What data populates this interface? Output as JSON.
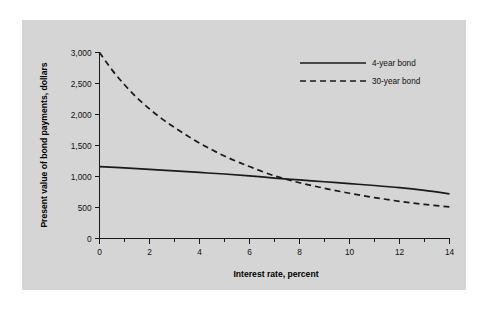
{
  "figure": {
    "panel_color": "#d5d5d5",
    "background_color": "#ffffff",
    "ink_color": "#1a1a1a"
  },
  "chart_data": {
    "type": "line",
    "title": "",
    "subtitle": "",
    "xlabel": "Interest rate, percent",
    "ylabel": "Present value of bond payments, dollars",
    "xlim": [
      0,
      14
    ],
    "ylim": [
      0,
      3000
    ],
    "xticks": [
      0,
      2,
      4,
      6,
      8,
      10,
      12,
      14
    ],
    "xticklabels": [
      "0",
      "2",
      "4",
      "6",
      "8",
      "10",
      "12",
      "14"
    ],
    "xminorticks": [
      1,
      3,
      5,
      7,
      9,
      11,
      13
    ],
    "yticks": [
      0,
      500,
      1000,
      1500,
      2000,
      2500,
      3000
    ],
    "yticklabels": [
      "0",
      "500",
      "1,000",
      "1,500",
      "2,000",
      "2,500",
      "3,000"
    ],
    "grid": false,
    "legend_position": "upper right",
    "annotations": [],
    "series": [
      {
        "name": "4-year bond",
        "style": "solid",
        "x": [
          0,
          1,
          2,
          3,
          4,
          5,
          6,
          7,
          8,
          9,
          10,
          11,
          12,
          13,
          14
        ],
        "values": [
          1160,
          1140,
          1115,
          1090,
          1065,
          1040,
          1010,
          975,
          945,
          915,
          885,
          855,
          820,
          775,
          720
        ]
      },
      {
        "name": "30-year bond",
        "style": "dashed",
        "x": [
          0,
          0.5,
          1,
          1.5,
          2,
          2.5,
          3,
          3.5,
          4,
          4.5,
          5,
          5.5,
          6,
          7,
          8,
          9,
          10,
          11,
          12,
          13,
          14
        ],
        "values": [
          3000,
          2720,
          2480,
          2270,
          2090,
          1930,
          1790,
          1660,
          1540,
          1430,
          1330,
          1240,
          1160,
          1010,
          900,
          810,
          730,
          660,
          600,
          550,
          510
        ]
      }
    ]
  },
  "legend": {
    "entries": [
      {
        "label": "4-year bond",
        "style": "solid"
      },
      {
        "label": "30-year bond",
        "style": "dashed"
      }
    ]
  }
}
